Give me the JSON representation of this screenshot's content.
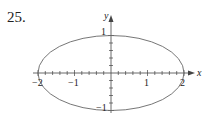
{
  "problem_number": "25.",
  "chart_data": {
    "type": "line",
    "title": "",
    "curve": "ellipse x^2/4 + y^2 = 1",
    "xlabel": "x",
    "ylabel": "y",
    "xlim": [
      -2,
      2
    ],
    "ylim": [
      -1,
      1
    ],
    "x_tick_labels": [
      "-2",
      "-1",
      "1",
      "2"
    ],
    "y_tick_labels": [
      "1",
      "-1"
    ],
    "minor_tick_spacing": 0.2,
    "grid": false,
    "semi_axes": {
      "a": 2,
      "b": 1
    },
    "series": [
      {
        "name": "ellipse",
        "color": "#555555"
      }
    ]
  },
  "labels": {
    "x_axis": "x",
    "y_axis": "y",
    "xm2": "−2",
    "xm1": "−1",
    "x1": "1",
    "x2": "2",
    "y1": "1",
    "ym1": "−1"
  }
}
